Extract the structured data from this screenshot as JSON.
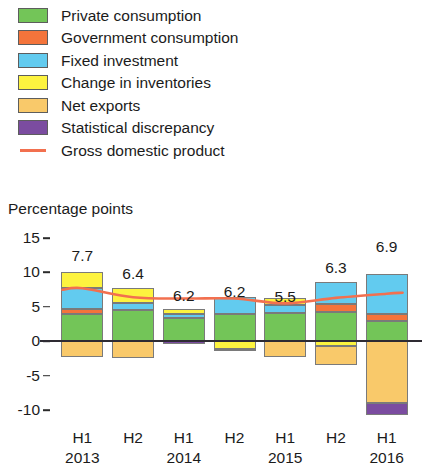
{
  "legend": {
    "items": [
      {
        "label": "Private consumption",
        "color": "#73c558",
        "icon": "color-swatch"
      },
      {
        "label": "Government consumption",
        "color": "#f4743b",
        "icon": "color-swatch"
      },
      {
        "label": "Fixed investment",
        "color": "#62cbef",
        "icon": "color-swatch"
      },
      {
        "label": "Change in inventories",
        "color": "#fdf33f",
        "icon": "color-swatch"
      },
      {
        "label": "Net exports",
        "color": "#f9c96a",
        "icon": "color-swatch"
      },
      {
        "label": "Statistical discrepancy",
        "color": "#7b4ca0",
        "icon": "color-swatch"
      },
      {
        "label": "Gross domestic product",
        "color": "#f2704f",
        "icon": "line-swatch"
      }
    ]
  },
  "axis_title": "Percentage points",
  "chart_data": {
    "type": "bar",
    "title": "",
    "subtitle": "",
    "xlabel": "",
    "ylabel": "Percentage points",
    "ylim": [
      -10,
      15
    ],
    "yticks": [
      15,
      10,
      5,
      0,
      -5,
      -10
    ],
    "ytick_labels": [
      "15",
      "10",
      "5",
      "0",
      "-5",
      "-10"
    ],
    "grid": false,
    "legend_position": "top-left",
    "stacked": true,
    "categories": [
      "H1",
      "H2",
      "H1",
      "H2",
      "H1",
      "H2",
      "H1"
    ],
    "category_years": [
      "2013",
      "",
      "2014",
      "",
      "2015",
      "",
      "2016"
    ],
    "series": [
      {
        "name": "Private consumption",
        "color": "#73c558",
        "values": [
          3.9,
          4.6,
          3.4,
          4.0,
          4.1,
          4.3,
          3.0
        ]
      },
      {
        "name": "Government consumption",
        "color": "#f4743b",
        "values": [
          0.8,
          0.0,
          0.0,
          0.0,
          0.0,
          1.1,
          1.0
        ]
      },
      {
        "name": "Fixed investment",
        "color": "#62cbef",
        "values": [
          3.1,
          0.9,
          0.5,
          2.4,
          1.2,
          3.2,
          5.7
        ]
      },
      {
        "name": "Change in inventories",
        "color": "#fdf33f",
        "values": [
          2.2,
          2.3,
          0.8,
          -1.1,
          1.0,
          -0.7,
          0.0
        ]
      },
      {
        "name": "Net exports",
        "color": "#f9c96a",
        "values": [
          -2.3,
          -2.5,
          0.0,
          0.0,
          -2.3,
          -2.8,
          -9.0
        ]
      },
      {
        "name": "Statistical discrepancy",
        "color": "#7b4ca0",
        "values": [
          0.0,
          0.0,
          -0.4,
          -0.2,
          0.0,
          0.0,
          -1.7
        ]
      }
    ],
    "gdp_line": {
      "name": "Gross domestic product",
      "color": "#f2704f",
      "values": [
        7.7,
        6.4,
        6.2,
        6.2,
        5.5,
        6.3,
        6.9
      ]
    },
    "bar_labels": [
      "7.7",
      "6.4",
      "6.2",
      "6.2",
      "5.5",
      "6.3",
      "6.9"
    ]
  }
}
